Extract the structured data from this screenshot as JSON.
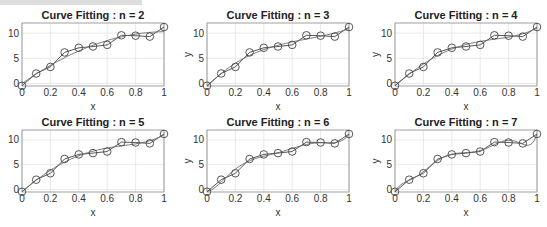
{
  "chart_data": [
    {
      "type": "line",
      "title": "Curve Fitting : n = 2",
      "xlabel": "x",
      "ylabel": "",
      "degree": 2
    },
    {
      "type": "line",
      "title": "Curve Fitting : n = 3",
      "xlabel": "x",
      "ylabel": "y",
      "degree": 3
    },
    {
      "type": "line",
      "title": "Curve Fitting : n = 4",
      "xlabel": "x",
      "ylabel": "y",
      "degree": 4
    },
    {
      "type": "line",
      "title": "Curve Fitting : n = 5",
      "xlabel": "x",
      "ylabel": "",
      "degree": 5
    },
    {
      "type": "line",
      "title": "Curve Fitting : n = 6",
      "xlabel": "x",
      "ylabel": "y",
      "degree": 6
    },
    {
      "type": "line",
      "title": "Curve Fitting : n = 7",
      "xlabel": "x",
      "ylabel": "y",
      "degree": 7
    }
  ],
  "shared": {
    "x": [
      0,
      0.1,
      0.2,
      0.3,
      0.4,
      0.5,
      0.6,
      0.7,
      0.8,
      0.9,
      1.0
    ],
    "y": [
      -0.45,
      1.98,
      3.28,
      6.16,
      7.08,
      7.34,
      7.66,
      9.56,
      9.48,
      9.3,
      11.2
    ],
    "xlim": [
      0,
      1
    ],
    "ylim": [
      -0.5,
      12
    ],
    "xticks": [
      "0",
      "0.2",
      "0.4",
      "0.6",
      "0.8",
      "1"
    ],
    "xtick_values": [
      0,
      0.2,
      0.4,
      0.6,
      0.8,
      1
    ],
    "yticks": [
      "0",
      "5",
      "10"
    ],
    "ytick_values": [
      0,
      5,
      10
    ],
    "grid": true,
    "series": [
      {
        "name": "data",
        "marker": "circle",
        "line": "solid"
      },
      {
        "name": "polynomial fit",
        "marker": "none",
        "line": "solid"
      }
    ]
  },
  "colors": {
    "line": "#444444",
    "grid": "#e3e3e3",
    "axes": "#888888"
  }
}
